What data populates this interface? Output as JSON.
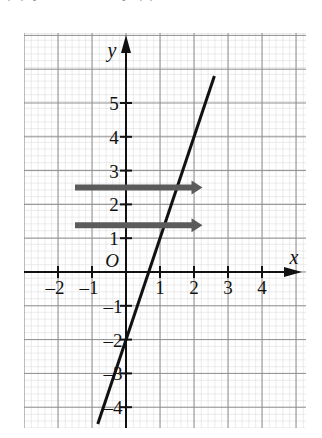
{
  "top_partial_text": "(c)  y = 3x − 2   y (      )",
  "graph": {
    "axis_labels": {
      "x": "x",
      "y": "y",
      "origin": "O"
    },
    "x_ticks": [
      {
        "value": -2,
        "label": "–2"
      },
      {
        "value": -1,
        "label": "–1"
      },
      {
        "value": 1,
        "label": "1"
      },
      {
        "value": 2,
        "label": "2"
      },
      {
        "value": 3,
        "label": "3"
      },
      {
        "value": 4,
        "label": "4"
      }
    ],
    "y_ticks": [
      {
        "value": 5,
        "label": "5"
      },
      {
        "value": 4,
        "label": "4"
      },
      {
        "value": 3,
        "label": "3"
      },
      {
        "value": 2,
        "label": "2"
      },
      {
        "value": 1,
        "label": "1"
      },
      {
        "value": -1,
        "label": "–1"
      },
      {
        "value": -2,
        "label": "–2"
      },
      {
        "value": -3,
        "label": "–3"
      },
      {
        "value": -4,
        "label": "–4"
      }
    ],
    "grid": {
      "minor_on": true,
      "major_on": true,
      "minor_color": "#c9c9c9",
      "major_color": "#8f8f8f",
      "minor_step": 0.2,
      "major_step": 1
    },
    "axis_color": "#111111",
    "curve_color": "#111111",
    "annotation_color": "#5b5b5b"
  },
  "chart_data": {
    "type": "line",
    "title": "",
    "xlabel": "x",
    "ylabel": "y",
    "xlim": [
      -3,
      5.3
    ],
    "ylim": [
      -4.8,
      6.8
    ],
    "grid": true,
    "legend": null,
    "series": [
      {
        "name": "y = 3x - 2",
        "equation": "y = 3x − 2",
        "slope": 3,
        "intercept": -2,
        "x_intercept": 0.6667,
        "points": [
          [
            -0.83,
            -4.5
          ],
          [
            2.6,
            5.8
          ]
        ]
      }
    ],
    "annotations": [
      {
        "kind": "arrow",
        "label": "reading arrow upper",
        "direction": "right",
        "x_start": -1.5,
        "x_end": 2.25,
        "y": 2.5
      },
      {
        "kind": "arrow",
        "label": "reading arrow lower",
        "direction": "right",
        "x_start": -1.5,
        "x_end": 2.25,
        "y": 1.38
      }
    ]
  }
}
